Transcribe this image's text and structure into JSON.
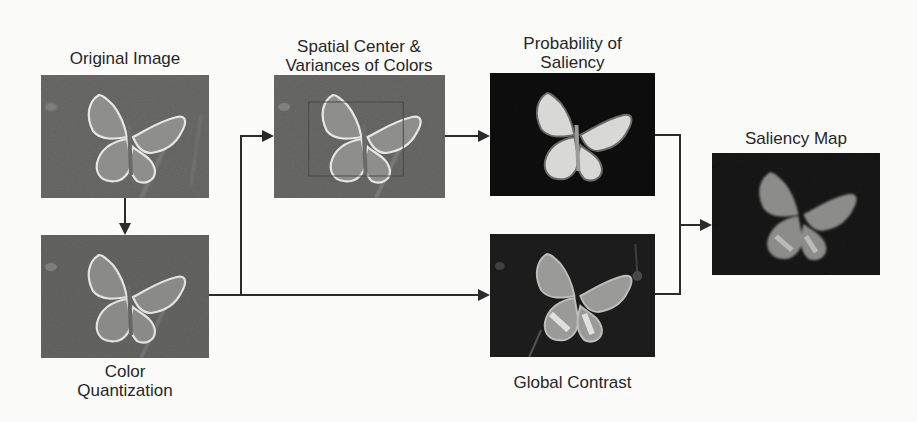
{
  "diagram": {
    "nodes": [
      {
        "id": "original",
        "label": "Original Image"
      },
      {
        "id": "quantization",
        "label_line1": "Color",
        "label_line2": "Quantization"
      },
      {
        "id": "spatial",
        "label_line1": "Spatial Center &",
        "label_line2": "Variances of Colors"
      },
      {
        "id": "probability",
        "label_line1": "Probability of",
        "label_line2": "Saliency"
      },
      {
        "id": "contrast",
        "label": "Global Contrast"
      },
      {
        "id": "saliency",
        "label": "Saliency Map"
      }
    ],
    "edges": [
      {
        "from": "original",
        "to": "quantization"
      },
      {
        "from": "quantization",
        "to": "spatial"
      },
      {
        "from": "quantization",
        "to": "contrast"
      },
      {
        "from": "spatial",
        "to": "probability"
      },
      {
        "from": "probability",
        "to": "saliency"
      },
      {
        "from": "contrast",
        "to": "saliency"
      }
    ],
    "colors": {
      "line": "#2b2b2b",
      "photo_bg": "#6a6a68",
      "map_bg": "#141414",
      "text": "#262626"
    }
  }
}
